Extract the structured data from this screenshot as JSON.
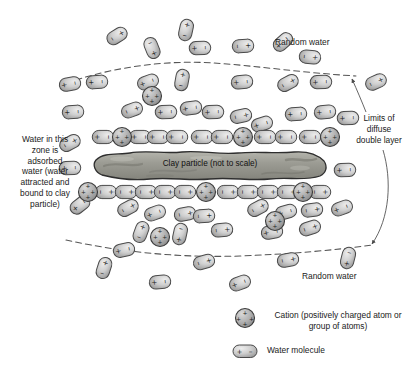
{
  "figure": {
    "background_color": "#ffffff",
    "width": 413,
    "height": 380
  },
  "annotations": {
    "random_water_top": "Random water",
    "random_water_bottom": "Random water",
    "adsorbed_water": "Water in this\nzone is\nadsorbed\nwater (water\nattracted and\nbound to clay\nparticle)",
    "diffuse_layer_limits": "Limits of\ndiffuse\ndouble layer",
    "clay_particle": "Clay particle (not to scale)"
  },
  "legend": {
    "items": [
      {
        "symbol": "cation-circle",
        "label": "Cation (positively charged atom\nor group of atoms)"
      },
      {
        "symbol": "water-capsule",
        "label": "Water molecule"
      }
    ]
  },
  "colors": {
    "molecule_fill_light": "#d8d8d8",
    "molecule_fill_dark": "#a8a8a8",
    "molecule_stroke": "#4a4a4a",
    "cation_fill": "#b0b0b0",
    "cation_stroke": "#3c3c3c",
    "clay_fill": "#9a9a93",
    "clay_stroke": "#2e2e2e",
    "boundary_line": "#555555",
    "text": "#1a1a1a"
  },
  "chart_data": {
    "type": "diagram",
    "clay_particle": {
      "x": 95,
      "y": 152,
      "width": 230,
      "height": 26,
      "charge": "negative",
      "label": "Clay particle (not to scale)"
    },
    "boundary": {
      "style": "dashed",
      "upper_y_center": 72,
      "lower_y_center": 248,
      "meaning": "Limits of diffuse double layer"
    },
    "zones": [
      {
        "name": "adsorbed water",
        "position": "within dashed boundary, adjacent to clay",
        "orientation": "ordered, dipoles aligned toward clay surface"
      },
      {
        "name": "random water",
        "position": "outside dashed boundary",
        "orientation": "random"
      }
    ],
    "water_molecules": [
      {
        "x": 117,
        "y": 36,
        "r": 58,
        "zone": "random"
      },
      {
        "x": 152,
        "y": 48,
        "r": -22,
        "zone": "random"
      },
      {
        "x": 186,
        "y": 30,
        "r": 12,
        "zone": "random"
      },
      {
        "x": 200,
        "y": 48,
        "r": 88,
        "zone": "random"
      },
      {
        "x": 243,
        "y": 46,
        "r": 86,
        "zone": "random"
      },
      {
        "x": 283,
        "y": 42,
        "r": 48,
        "zone": "random"
      },
      {
        "x": 310,
        "y": 57,
        "r": 96,
        "zone": "random"
      },
      {
        "x": 70,
        "y": 84,
        "r": 80,
        "zone": "adsorbed"
      },
      {
        "x": 97,
        "y": 82,
        "r": 86,
        "zone": "adsorbed"
      },
      {
        "x": 148,
        "y": 82,
        "r": 70,
        "zone": "adsorbed"
      },
      {
        "x": 182,
        "y": 80,
        "r": 10,
        "zone": "adsorbed"
      },
      {
        "x": 242,
        "y": 82,
        "r": 84,
        "zone": "adsorbed"
      },
      {
        "x": 288,
        "y": 83,
        "r": 62,
        "zone": "adsorbed"
      },
      {
        "x": 321,
        "y": 82,
        "r": 88,
        "zone": "adsorbed"
      },
      {
        "x": 376,
        "y": 82,
        "r": 66,
        "zone": "random"
      },
      {
        "x": 73,
        "y": 112,
        "r": 86,
        "zone": "adsorbed"
      },
      {
        "x": 132,
        "y": 110,
        "r": 70,
        "zone": "adsorbed"
      },
      {
        "x": 166,
        "y": 112,
        "r": 88,
        "zone": "adsorbed"
      },
      {
        "x": 191,
        "y": 108,
        "r": 82,
        "zone": "adsorbed"
      },
      {
        "x": 213,
        "y": 112,
        "r": 88,
        "zone": "adsorbed"
      },
      {
        "x": 241,
        "y": 116,
        "r": 78,
        "zone": "adsorbed"
      },
      {
        "x": 262,
        "y": 124,
        "r": 72,
        "zone": "adsorbed"
      },
      {
        "x": 296,
        "y": 114,
        "r": 86,
        "zone": "adsorbed"
      },
      {
        "x": 325,
        "y": 112,
        "r": 84,
        "zone": "adsorbed"
      },
      {
        "x": 348,
        "y": 118,
        "r": 88,
        "zone": "adsorbed"
      },
      {
        "x": 103,
        "y": 137,
        "r": 90,
        "zone": "adsorbed"
      },
      {
        "x": 140,
        "y": 137,
        "r": 90,
        "zone": "adsorbed"
      },
      {
        "x": 158,
        "y": 137,
        "r": 90,
        "zone": "adsorbed"
      },
      {
        "x": 177,
        "y": 137,
        "r": 90,
        "zone": "adsorbed"
      },
      {
        "x": 202,
        "y": 137,
        "r": 90,
        "zone": "adsorbed"
      },
      {
        "x": 222,
        "y": 137,
        "r": 90,
        "zone": "adsorbed"
      },
      {
        "x": 265,
        "y": 137,
        "r": 90,
        "zone": "adsorbed"
      },
      {
        "x": 286,
        "y": 137,
        "r": 90,
        "zone": "adsorbed"
      },
      {
        "x": 310,
        "y": 137,
        "r": 90,
        "zone": "adsorbed"
      },
      {
        "x": 70,
        "y": 143,
        "r": 62,
        "zone": "adsorbed"
      },
      {
        "x": 70,
        "y": 168,
        "r": 88,
        "zone": "adsorbed"
      },
      {
        "x": 345,
        "y": 170,
        "r": 88,
        "zone": "adsorbed"
      },
      {
        "x": 106,
        "y": 192,
        "r": 90,
        "zone": "adsorbed"
      },
      {
        "x": 126,
        "y": 192,
        "r": 90,
        "zone": "adsorbed"
      },
      {
        "x": 146,
        "y": 192,
        "r": 90,
        "zone": "adsorbed"
      },
      {
        "x": 165,
        "y": 192,
        "r": 90,
        "zone": "adsorbed"
      },
      {
        "x": 185,
        "y": 192,
        "r": 90,
        "zone": "adsorbed"
      },
      {
        "x": 228,
        "y": 192,
        "r": 90,
        "zone": "adsorbed"
      },
      {
        "x": 248,
        "y": 192,
        "r": 90,
        "zone": "adsorbed"
      },
      {
        "x": 268,
        "y": 192,
        "r": 90,
        "zone": "adsorbed"
      },
      {
        "x": 288,
        "y": 192,
        "r": 90,
        "zone": "adsorbed"
      },
      {
        "x": 320,
        "y": 192,
        "r": 90,
        "zone": "adsorbed"
      },
      {
        "x": 80,
        "y": 205,
        "r": 52,
        "zone": "adsorbed"
      },
      {
        "x": 128,
        "y": 208,
        "r": 62,
        "zone": "adsorbed"
      },
      {
        "x": 155,
        "y": 213,
        "r": 70,
        "zone": "adsorbed"
      },
      {
        "x": 185,
        "y": 214,
        "r": 80,
        "zone": "adsorbed"
      },
      {
        "x": 204,
        "y": 216,
        "r": 86,
        "zone": "adsorbed"
      },
      {
        "x": 258,
        "y": 208,
        "r": 62,
        "zone": "adsorbed"
      },
      {
        "x": 286,
        "y": 212,
        "r": 74,
        "zone": "adsorbed"
      },
      {
        "x": 312,
        "y": 210,
        "r": 82,
        "zone": "adsorbed"
      },
      {
        "x": 342,
        "y": 208,
        "r": 70,
        "zone": "adsorbed"
      },
      {
        "x": 141,
        "y": 232,
        "r": 20,
        "zone": "adsorbed"
      },
      {
        "x": 180,
        "y": 234,
        "r": 12,
        "zone": "adsorbed"
      },
      {
        "x": 222,
        "y": 230,
        "r": 84,
        "zone": "adsorbed"
      },
      {
        "x": 272,
        "y": 232,
        "r": 80,
        "zone": "adsorbed"
      },
      {
        "x": 310,
        "y": 228,
        "r": 72,
        "zone": "adsorbed"
      },
      {
        "x": 124,
        "y": 250,
        "r": 78,
        "zone": "random"
      },
      {
        "x": 104,
        "y": 268,
        "r": 18,
        "zone": "random"
      },
      {
        "x": 160,
        "y": 282,
        "r": 84,
        "zone": "random"
      },
      {
        "x": 204,
        "y": 262,
        "r": 74,
        "zone": "random"
      },
      {
        "x": 240,
        "y": 283,
        "r": 70,
        "zone": "random"
      },
      {
        "x": 288,
        "y": 260,
        "r": 80,
        "zone": "random"
      },
      {
        "x": 348,
        "y": 258,
        "r": 14,
        "zone": "random"
      }
    ],
    "cations": [
      {
        "x": 152,
        "y": 96,
        "r": 9.5
      },
      {
        "x": 122,
        "y": 137,
        "r": 9.5
      },
      {
        "x": 243,
        "y": 137,
        "r": 9.5
      },
      {
        "x": 330,
        "y": 137,
        "r": 9.5
      },
      {
        "x": 88,
        "y": 192,
        "r": 9.5
      },
      {
        "x": 206,
        "y": 192,
        "r": 9.5
      },
      {
        "x": 303,
        "y": 192,
        "r": 9.5
      },
      {
        "x": 275,
        "y": 221,
        "r": 9.5
      },
      {
        "x": 160,
        "y": 237,
        "r": 9.5
      }
    ]
  }
}
